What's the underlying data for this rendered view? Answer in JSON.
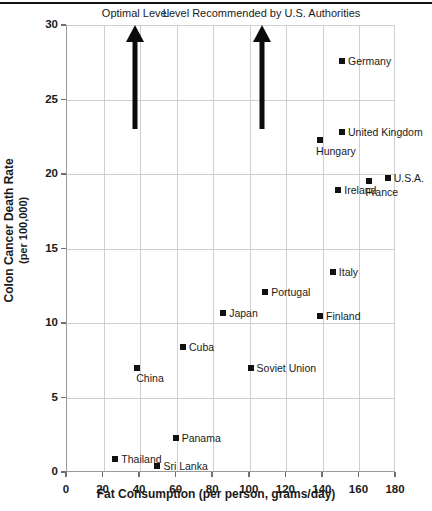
{
  "chart_data": {
    "type": "scatter",
    "title": "",
    "xlabel": "Fat Consumption (per person, grams/day)",
    "ylabel_line1": "Colon Cancer Death Rate",
    "ylabel_line2": "(per 100,000)",
    "xlim": [
      0,
      180
    ],
    "ylim": [
      0,
      30
    ],
    "xticks": [
      0,
      20,
      40,
      60,
      80,
      100,
      120,
      140,
      160,
      180
    ],
    "yticks": [
      0,
      5,
      10,
      15,
      20,
      25,
      30
    ],
    "grid": true,
    "legend": "none",
    "marker_color": "#111111",
    "points": [
      {
        "label": "Germany",
        "x": 151,
        "y": 27.6,
        "label_pos": "right"
      },
      {
        "label": "United Kingdom",
        "x": 151,
        "y": 22.8,
        "label_pos": "right"
      },
      {
        "label": "Hungary",
        "x": 139,
        "y": 22.3,
        "label_pos": "belowleft"
      },
      {
        "label": "U.S.A.",
        "x": 176,
        "y": 19.7,
        "label_pos": "right"
      },
      {
        "label": "France",
        "x": 166,
        "y": 19.5,
        "label_pos": "belowleft"
      },
      {
        "label": "Ireland",
        "x": 149,
        "y": 18.9,
        "label_pos": "right"
      },
      {
        "label": "Italy",
        "x": 146,
        "y": 13.4,
        "label_pos": "right"
      },
      {
        "label": "Portugal",
        "x": 109,
        "y": 12.1,
        "label_pos": "right"
      },
      {
        "label": "Japan",
        "x": 86,
        "y": 10.7,
        "label_pos": "right"
      },
      {
        "label": "Finland",
        "x": 139,
        "y": 10.5,
        "label_pos": "right"
      },
      {
        "label": "Cuba",
        "x": 64,
        "y": 8.4,
        "label_pos": "right"
      },
      {
        "label": "China",
        "x": 39,
        "y": 7.0,
        "label_pos": "below"
      },
      {
        "label": "Soviet Union",
        "x": 101,
        "y": 7.0,
        "label_pos": "right"
      },
      {
        "label": "Panama",
        "x": 60,
        "y": 2.3,
        "label_pos": "right"
      },
      {
        "label": "Thailand",
        "x": 27,
        "y": 0.9,
        "label_pos": "right"
      },
      {
        "label": "Sri Lanka",
        "x": 50,
        "y": 0.4,
        "label_pos": "right"
      }
    ],
    "annotations": [
      {
        "text": "Optimal Level",
        "x": 38,
        "y_from": 23,
        "y_to": 30
      },
      {
        "text": "Level Recommended by U.S. Authorities",
        "x": 107,
        "y_from": 23,
        "y_to": 30
      }
    ]
  }
}
